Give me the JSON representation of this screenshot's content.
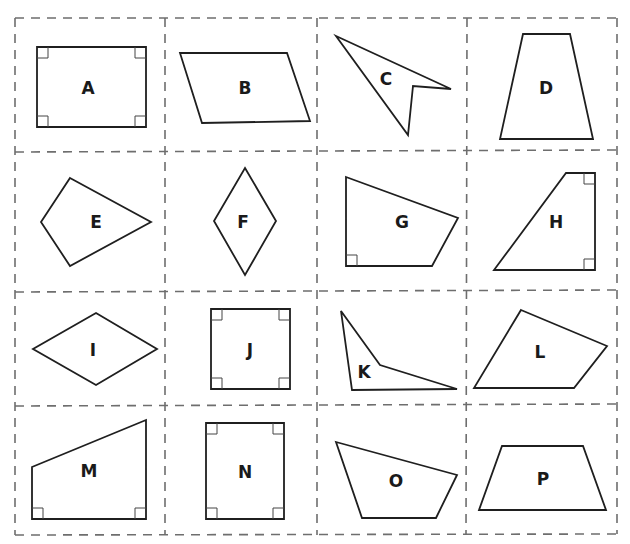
{
  "grid": {
    "rows": 4,
    "cols": 4,
    "line_color": "#6e6e6e",
    "line_style": "dashed"
  },
  "shapes": [
    {
      "label": "A",
      "kind": "rectangle",
      "right_angles": 4
    },
    {
      "label": "B",
      "kind": "parallelogram",
      "right_angles": 0
    },
    {
      "label": "C",
      "kind": "concave quadrilateral (arrowhead)",
      "right_angles": 0
    },
    {
      "label": "D",
      "kind": "isosceles trapezoid",
      "right_angles": 0
    },
    {
      "label": "E",
      "kind": "kite",
      "right_angles": 0
    },
    {
      "label": "F",
      "kind": "rhombus",
      "right_angles": 0
    },
    {
      "label": "G",
      "kind": "quadrilateral",
      "right_angles": 1
    },
    {
      "label": "H",
      "kind": "right trapezoid",
      "right_angles": 2
    },
    {
      "label": "I",
      "kind": "rhombus",
      "right_angles": 0
    },
    {
      "label": "J",
      "kind": "square",
      "right_angles": 4
    },
    {
      "label": "K",
      "kind": "concave quadrilateral",
      "right_angles": 0
    },
    {
      "label": "L",
      "kind": "quadrilateral",
      "right_angles": 0
    },
    {
      "label": "M",
      "kind": "right trapezoid",
      "right_angles": 2
    },
    {
      "label": "N",
      "kind": "rectangle",
      "right_angles": 4
    },
    {
      "label": "O",
      "kind": "quadrilateral",
      "right_angles": 0
    },
    {
      "label": "P",
      "kind": "isosceles trapezoid",
      "right_angles": 0
    }
  ]
}
